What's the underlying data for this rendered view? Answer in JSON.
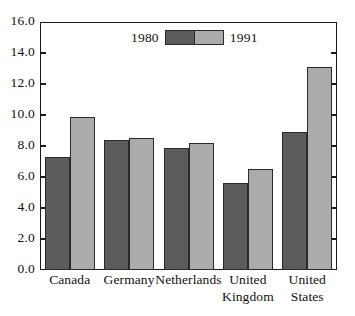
{
  "chart_data": {
    "type": "bar",
    "title": "",
    "subtitle": "",
    "xlabel": "",
    "ylabel": "",
    "categories": [
      "Canada",
      "Germany",
      "Netherlands",
      "United\nKingdom",
      "United\nStates"
    ],
    "series": [
      {
        "name": "1980",
        "color": "#5c5c5c",
        "values": [
          7.3,
          8.4,
          7.9,
          5.6,
          8.9
        ]
      },
      {
        "name": "1991",
        "color": "#ababab",
        "values": [
          9.9,
          8.5,
          8.2,
          6.5,
          13.1
        ]
      }
    ],
    "ylim": [
      0.0,
      16.0
    ],
    "yticks": [
      "0.0",
      "2.0",
      "4.0",
      "6.0",
      "8.0",
      "10.0",
      "12.0",
      "14.0",
      "16.0"
    ],
    "ytick_values": [
      0.0,
      2.0,
      4.0,
      6.0,
      8.0,
      10.0,
      12.0,
      14.0,
      16.0
    ],
    "grid": false,
    "legend_position": "top-center",
    "frame": true
  },
  "legend": {
    "left_label": "1980",
    "right_label": "1991"
  }
}
